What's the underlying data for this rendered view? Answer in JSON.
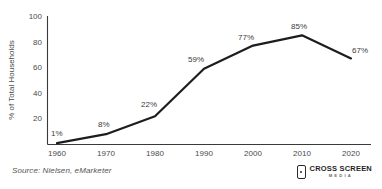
{
  "chart_data": {
    "type": "line",
    "title": "",
    "xlabel": "",
    "ylabel": "% of Total Households",
    "categories": [
      "1960",
      "1970",
      "1980",
      "1990",
      "2000",
      "2010",
      "2020"
    ],
    "x": [
      1960,
      1970,
      1980,
      1990,
      2000,
      2010,
      2020
    ],
    "values": [
      1,
      8,
      22,
      59,
      77,
      85,
      67
    ],
    "point_labels": [
      "1%",
      "8%",
      "22%",
      "59%",
      "77%",
      "85%",
      "67%"
    ],
    "ylim": [
      0,
      100
    ],
    "y_ticks": [
      "100",
      "80",
      "60",
      "40",
      "20"
    ],
    "y_tick_values": [
      100,
      80,
      60,
      40,
      20
    ],
    "xlim": [
      1960,
      2020
    ],
    "grid": false,
    "legend": null,
    "series": [
      {
        "name": "% of Total Households",
        "values": [
          1,
          8,
          22,
          59,
          77,
          85,
          67
        ],
        "color": "#1d1d1d"
      }
    ],
    "colors": {
      "line": "#1d1d1d",
      "axis": "#3a3a3a",
      "tick_text": "#4a4a4a",
      "label_text": "#3b3b3b",
      "background": "#ffffff"
    }
  },
  "footer": {
    "source_note": "Source: Nielsen, eMarketer"
  },
  "brand": {
    "primary": "CROSS SCREEN",
    "secondary": "MEDIA",
    "icon": "mobile-device-icon"
  }
}
